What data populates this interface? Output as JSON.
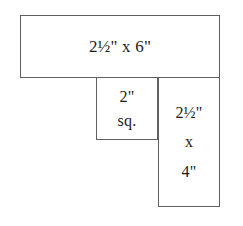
{
  "diagram": {
    "stroke_color": "#5f6063",
    "fill_color": "#ffffff",
    "text_color": "#1b1b1b",
    "background_color": "#ffffff",
    "shapes": [
      {
        "id": "top-bar",
        "name": "top-bar",
        "label_lines": [
          "2½\" x 6\""
        ],
        "dimensions": {
          "width": "6\"",
          "height": "2½\""
        }
      },
      {
        "id": "middle-square",
        "name": "middle-square",
        "label_lines": [
          "2\"",
          "sq."
        ],
        "dimensions": {
          "width": "2\"",
          "height": "2\""
        }
      },
      {
        "id": "right-rect",
        "name": "right-rect",
        "label_lines": [
          "2½\"",
          "x",
          "4\""
        ],
        "dimensions": {
          "width": "2½\"",
          "height": "4\""
        }
      }
    ]
  }
}
